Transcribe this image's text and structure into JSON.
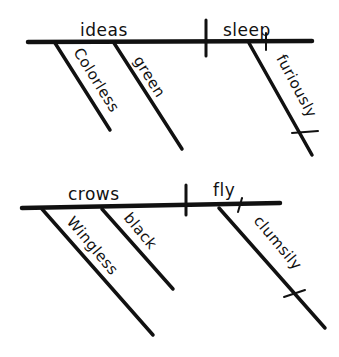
{
  "diagram": {
    "type": "Reed-Kellogg sentence diagram",
    "colors": {
      "ink": "#111111",
      "background": "#ffffff"
    },
    "sentences": [
      {
        "subject": "ideas",
        "verb": "sleep",
        "subject_modifiers": [
          "Colorless",
          "green"
        ],
        "verb_modifiers": [
          "furiously"
        ]
      },
      {
        "subject": "crows",
        "verb": "fly",
        "subject_modifiers": [
          "Wingless",
          "black"
        ],
        "verb_modifiers": [
          "clumsily"
        ]
      }
    ]
  }
}
